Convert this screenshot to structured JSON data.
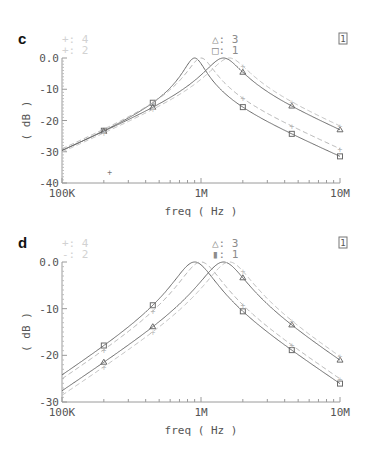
{
  "chart_data": [
    {
      "panel": "c",
      "type": "line",
      "title": "",
      "xlabel": "freq ( Hz )",
      "ylabel": "( dB )",
      "xscale": "log",
      "xlim": [
        100000,
        10000000
      ],
      "ylim": [
        -40,
        0
      ],
      "x_tick_labels": [
        "100K",
        "1M",
        "10M"
      ],
      "y_tick_labels": [
        "0.0",
        "-10",
        "-20",
        "-30",
        "-40"
      ],
      "legend": [
        {
          "marker": "+",
          "label": "4",
          "color": "#c8c8c8"
        },
        {
          "marker": "+",
          "label": "2",
          "color": "#c8c8c8"
        },
        {
          "marker": "triangle",
          "label": "3",
          "color": "#8a8a8a"
        },
        {
          "marker": "square",
          "label": "1",
          "color": "#8a8a8a"
        }
      ],
      "corner_badge": "1",
      "stray_marker": {
        "x": 220000,
        "y": -36.5
      },
      "series": [
        {
          "name": "1",
          "style": "solid",
          "color": "#6a6a6a",
          "peak_freq": 900000,
          "x": [
            100000,
            200000,
            450000,
            1000000,
            2000000,
            4500000,
            10000000
          ],
          "y": [
            -28.5,
            -22.5,
            -14.5,
            -1.0,
            -16.5,
            -25.0,
            -31.5
          ]
        },
        {
          "name": "2",
          "style": "dashed",
          "color": "#b4b4b4",
          "peak_freq": 1000000,
          "x": [
            100000,
            200000,
            450000,
            1000000,
            2000000,
            4500000,
            10000000
          ],
          "y": [
            -29.0,
            -23.5,
            -15.5,
            -1.5,
            -15.5,
            -24.0,
            -30.5
          ]
        },
        {
          "name": "3",
          "style": "solid",
          "color": "#6a6a6a",
          "peak_freq": 1450000,
          "x": [
            100000,
            200000,
            450000,
            1000000,
            2000000,
            4500000,
            10000000
          ],
          "y": [
            -29.5,
            -25.5,
            -19.5,
            -9.0,
            -5.0,
            -19.5,
            -27.0
          ]
        },
        {
          "name": "4",
          "style": "dashed",
          "color": "#c0c0c0",
          "peak_freq": 1600000,
          "x": [
            100000,
            200000,
            450000,
            1000000,
            2000000,
            4500000,
            10000000
          ],
          "y": [
            -30.0,
            -26.5,
            -21.0,
            -11.0,
            -4.0,
            -18.0,
            -25.5
          ]
        }
      ]
    },
    {
      "panel": "d",
      "type": "line",
      "title": "",
      "xlabel": "freq ( Hz )",
      "ylabel": "( dB )",
      "xscale": "log",
      "xlim": [
        100000,
        10000000
      ],
      "ylim": [
        -30,
        0
      ],
      "x_tick_labels": [
        "100K",
        "1M",
        "10M"
      ],
      "y_tick_labels": [
        "0.0",
        "-10",
        "-20",
        "-30"
      ],
      "legend": [
        {
          "marker": "+",
          "label": "4",
          "color": "#c8c8c8"
        },
        {
          "marker": "+",
          "label": "2",
          "color": "#c8c8c8"
        },
        {
          "marker": "triangle",
          "label": "3",
          "color": "#8a8a8a"
        },
        {
          "marker": "bar",
          "label": "1",
          "color": "#8a8a8a"
        }
      ],
      "corner_badge": "1",
      "series": [
        {
          "name": "1",
          "style": "solid",
          "color": "#6a6a6a",
          "peak_freq": 900000,
          "x": [
            100000,
            200000,
            450000,
            1000000,
            2000000,
            4500000,
            10000000
          ],
          "y": [
            -24.5,
            -18.0,
            -10.0,
            -0.5,
            -11.5,
            -19.0,
            -26.0
          ]
        },
        {
          "name": "2",
          "style": "dashed",
          "color": "#b4b4b4",
          "peak_freq": 1000000,
          "x": [
            100000,
            200000,
            450000,
            1000000,
            2000000,
            4500000,
            10000000
          ],
          "y": [
            -25.5,
            -19.0,
            -11.5,
            -1.0,
            -10.0,
            -18.0,
            -25.0
          ]
        },
        {
          "name": "3",
          "style": "solid",
          "color": "#6a6a6a",
          "peak_freq": 1450000,
          "x": [
            100000,
            200000,
            450000,
            1000000,
            2000000,
            4500000,
            10000000
          ],
          "y": [
            -27.5,
            -22.0,
            -15.0,
            -5.5,
            -4.5,
            -14.5,
            -22.5
          ]
        },
        {
          "name": "4",
          "style": "dashed",
          "color": "#c0c0c0",
          "peak_freq": 1600000,
          "x": [
            100000,
            200000,
            450000,
            1000000,
            2000000,
            4500000,
            10000000
          ],
          "y": [
            -28.5,
            -23.5,
            -16.5,
            -7.5,
            -3.0,
            -13.0,
            -21.0
          ]
        }
      ]
    }
  ],
  "panels": {
    "c": {
      "label": "c",
      "legend_left": [
        {
          "sym": "+:",
          "num": "4"
        },
        {
          "sym": "+:",
          "num": "2"
        }
      ],
      "legend_right": [
        {
          "sym": "△:",
          "num": "3"
        },
        {
          "sym": "□:",
          "num": "1"
        }
      ],
      "badge": "1",
      "xlabel": "freq ( Hz )",
      "ylabel": "( dB )",
      "xticks": [
        "100K",
        "1M",
        "10M"
      ],
      "yticks": [
        "0.0",
        "-10",
        "-20",
        "-30",
        "-40"
      ]
    },
    "d": {
      "label": "d",
      "legend_left": [
        {
          "sym": "+:",
          "num": "4"
        },
        {
          "sym": "-:",
          "num": "2"
        }
      ],
      "legend_right": [
        {
          "sym": "△:",
          "num": "3"
        },
        {
          "sym": "▮:",
          "num": "1"
        }
      ],
      "badge": "1",
      "xlabel": "freq ( Hz )",
      "ylabel": "( dB )",
      "xticks": [
        "100K",
        "1M",
        "10M"
      ],
      "yticks": [
        "0.0",
        "-10",
        "-20",
        "-30"
      ]
    }
  }
}
